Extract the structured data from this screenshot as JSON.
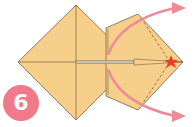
{
  "step": {
    "number": "6"
  },
  "colors": {
    "paper": "#f6d08a",
    "edge": "#7a6040",
    "arrow": "#ef8a96",
    "star": "#ee3b2b",
    "badge": "#f07a8a"
  },
  "diagram": {
    "arrows": [
      "open-upper-flap-arrow",
      "open-lower-flap-arrow"
    ],
    "fold_lines": [
      "valley-fold-dashed-upper",
      "valley-fold-dashed-lower"
    ],
    "marker": "star-icon"
  }
}
